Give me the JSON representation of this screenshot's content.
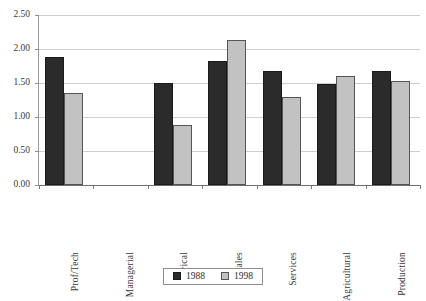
{
  "chart_data": {
    "type": "bar",
    "title": "",
    "xlabel": "",
    "ylabel": "",
    "ylim": [
      0.0,
      2.5
    ],
    "yticks": [
      "0.00",
      "0.50",
      "1.00",
      "1.50",
      "2.00",
      "2.50"
    ],
    "ytick_values": [
      0.0,
      0.5,
      1.0,
      1.5,
      2.0,
      2.5
    ],
    "grid": true,
    "legend_position": "bottom-center",
    "categories": [
      "Prof/Tech",
      "Managerial",
      "Clerical",
      "Sales",
      "Services",
      "Agricultural",
      "Production"
    ],
    "series": [
      {
        "name": "1988",
        "color": "#2b2b2b",
        "values": [
          1.88,
          null,
          1.5,
          1.82,
          1.67,
          1.48,
          1.67
        ]
      },
      {
        "name": "1998",
        "color": "#c2c2c2",
        "values": [
          1.35,
          null,
          0.88,
          2.13,
          1.3,
          1.61,
          1.53
        ]
      }
    ]
  },
  "legend": {
    "entries": [
      {
        "label": "1988"
      },
      {
        "label": "1998"
      }
    ]
  }
}
